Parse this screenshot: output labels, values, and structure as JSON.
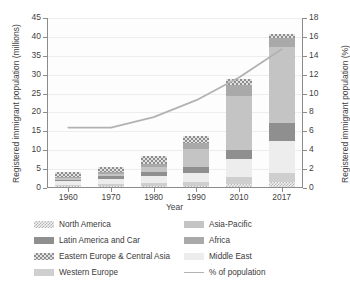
{
  "chart_data": {
    "type": "bar",
    "title": "",
    "xlabel": "Year",
    "ylabel": "Registered immigrant population (millions)",
    "ylabel_secondary": "Registered immigrant population (%)",
    "categories": [
      "1960",
      "1970",
      "1980",
      "1990",
      "2010",
      "2017"
    ],
    "ylim": [
      0,
      45
    ],
    "yticks": [
      "0",
      "5",
      "10",
      "15",
      "20",
      "25",
      "30",
      "35",
      "40",
      "45"
    ],
    "ylim_secondary": [
      0,
      18
    ],
    "yticks_secondary": [
      "0",
      "2",
      "4",
      "6",
      "8",
      "10",
      "12",
      "14",
      "16",
      "18"
    ],
    "grid": true,
    "legend_position": "bottom",
    "stacked": true,
    "series": [
      {
        "name": "North America",
        "axis": "left",
        "color": "#e9e9e9",
        "pattern": "dots",
        "values": [
          0.15,
          0.2,
          0.3,
          0.4,
          0.9,
          1.2
        ]
      },
      {
        "name": "Western Europe",
        "axis": "left",
        "color": "#cfcfcf",
        "pattern": "solid",
        "values": [
          0.4,
          0.5,
          0.8,
          1.0,
          1.8,
          2.4
        ]
      },
      {
        "name": "Middle East",
        "axis": "left",
        "color": "#ededed",
        "pattern": "solid",
        "values": [
          1.0,
          1.5,
          1.9,
          2.4,
          4.8,
          8.7
        ]
      },
      {
        "name": "Latin America and Car",
        "axis": "left",
        "color": "#8f8f8f",
        "pattern": "solid",
        "values": [
          0.35,
          0.7,
          1.1,
          1.4,
          2.3,
          4.7
        ]
      },
      {
        "name": "Asia-Pacific",
        "axis": "left",
        "color": "#c4c4c4",
        "pattern": "solid",
        "values": [
          0.4,
          0.6,
          1.3,
          4.9,
          14.3,
          20.0
        ]
      },
      {
        "name": "Africa",
        "axis": "left",
        "color": "#a9a9a9",
        "pattern": "solid",
        "values": [
          0.3,
          0.4,
          0.8,
          1.6,
          3.0,
          2.5
        ]
      },
      {
        "name": "Eastern Europe & Central Asia",
        "axis": "left",
        "color": "#b9b9b9",
        "pattern": "checkered",
        "values": [
          1.4,
          1.5,
          2.1,
          1.9,
          1.4,
          1.1
        ]
      },
      {
        "name": "% of population",
        "axis": "right",
        "type": "line",
        "color": "#b2b2b2",
        "values": [
          6.4,
          6.4,
          7.5,
          9.3,
          11.7,
          14.7
        ]
      }
    ],
    "stack_totals": [
      4.0,
      5.4,
      8.3,
      13.6,
      28.5,
      40.6
    ]
  },
  "legend": {
    "items": [
      {
        "label": "North America",
        "swatch": "dots-swatch"
      },
      {
        "label": "Asia-Pacific",
        "swatch": "solid-swatch"
      },
      {
        "label": "Latin America and Car",
        "swatch": "solid-swatch"
      },
      {
        "label": "Africa",
        "swatch": "solid-swatch"
      },
      {
        "label": "Eastern Europe & Central Asia",
        "swatch": "checkered-swatch"
      },
      {
        "label": "Middle East",
        "swatch": "solid-swatch"
      },
      {
        "label": "Western Europe",
        "swatch": "solid-swatch"
      },
      {
        "label": "% of population",
        "swatch": "line-swatch"
      }
    ]
  }
}
